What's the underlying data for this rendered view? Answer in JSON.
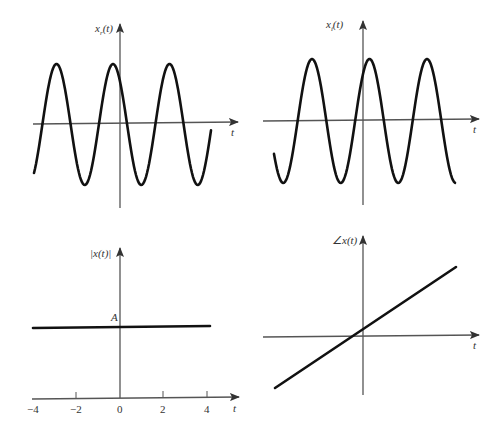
{
  "figure": {
    "panels": [
      {
        "id": "real-part",
        "ylabel": "x_r(t)",
        "ylabel_main": "x",
        "ylabel_sub": "r",
        "ylabel_rest": "(t)",
        "xlabel": "t",
        "type": "sinusoid"
      },
      {
        "id": "imag-part",
        "ylabel": "x_i(t)",
        "ylabel_main": "x",
        "ylabel_sub": "i",
        "ylabel_rest": "(t)",
        "xlabel": "t",
        "type": "sinusoid"
      },
      {
        "id": "magnitude",
        "ylabel": "|x(t)|",
        "xlabel": "t",
        "level_label": "A",
        "type": "constant",
        "ticks": [
          "−4",
          "−2",
          "0",
          "2",
          "4"
        ]
      },
      {
        "id": "phase",
        "ylabel": "∠x(t)",
        "xlabel": "t",
        "type": "linear"
      }
    ]
  },
  "chart_data": [
    {
      "type": "line",
      "title": "",
      "ylabel": "x_r(t)",
      "xlabel": "t",
      "description": "Real part: sinusoid, ~3 periods visible, peak slightly before t=0",
      "amplitude": 1,
      "periods_visible": 3.1
    },
    {
      "type": "line",
      "title": "",
      "ylabel": "x_i(t)",
      "xlabel": "t",
      "description": "Imaginary part: sinusoid, ~3 periods visible, peak slightly after t=0",
      "amplitude": 1,
      "periods_visible": 3.2
    },
    {
      "type": "line",
      "title": "",
      "ylabel": "|x(t)|",
      "xlabel": "t",
      "x": [
        -4,
        4
      ],
      "values": [
        "A",
        "A"
      ],
      "xticks": [
        -4,
        -2,
        0,
        2,
        4
      ],
      "yticks": [
        "A"
      ],
      "description": "Magnitude constant at A"
    },
    {
      "type": "line",
      "title": "",
      "ylabel": "∠x(t)",
      "xlabel": "t",
      "description": "Phase increases linearly in t, crossing zero slightly left of t=0"
    }
  ]
}
